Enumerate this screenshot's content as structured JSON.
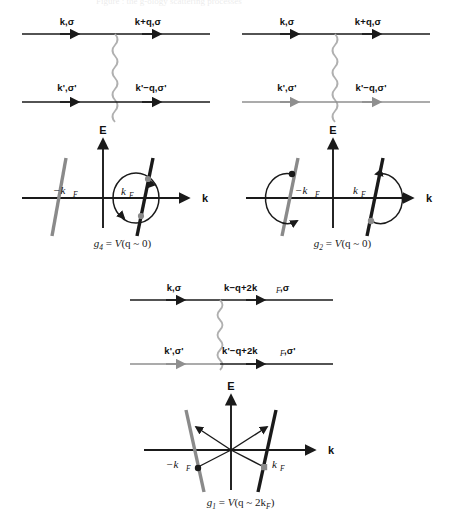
{
  "figure": {
    "header_faint": "Figure : the g-ology scattering processes",
    "background": "#ffffff",
    "colors": {
      "black": "#1a1a1a",
      "gray": "#8f8f8f",
      "wavy": "#b0b0b0",
      "band_black": "#1a1a1a",
      "band_gray": "#8a8a8a"
    }
  },
  "panels": [
    {
      "id": "g4",
      "diagram": {
        "top_in": "k,σ",
        "top_out": "k+q,σ",
        "bottom_in": "k',σ'",
        "bottom_out": "k'−q,σ'",
        "top_line_color": "#1a1a1a",
        "bottom_line_color": "#1a1a1a",
        "wavy_color": "#b0b0b0"
      },
      "plot": {
        "y_axis_label": "E",
        "x_axis_label": "k",
        "left_tick": "−k",
        "left_tick_sub": "F",
        "right_tick": "k",
        "right_tick_sub": "F",
        "left_band_color": "#8a8a8a",
        "right_band_color": "#1a1a1a",
        "annotation": "full loop at +kF"
      },
      "caption": {
        "name": "g",
        "sub": "4",
        "eq": " = ",
        "rhs_v": "V",
        "rhs_arg": "(q ~ 0)"
      }
    },
    {
      "id": "g2",
      "diagram": {
        "top_in": "k,σ",
        "top_out": "k+q,σ",
        "bottom_in": "k',σ'",
        "bottom_out": "k'−q,σ'",
        "top_line_color": "#1a1a1a",
        "bottom_line_color": "#8f8f8f",
        "wavy_color": "#b0b0b0"
      },
      "plot": {
        "y_axis_label": "E",
        "x_axis_label": "k",
        "left_tick": "−k",
        "left_tick_sub": "F",
        "right_tick": "k",
        "right_tick_sub": "F",
        "left_band_color": "#8a8a8a",
        "right_band_color": "#1a1a1a",
        "annotation": "half arcs at both ±kF"
      },
      "caption": {
        "name": "g",
        "sub": "2",
        "eq": " = ",
        "rhs_v": "V",
        "rhs_arg": "(q ~ 0)"
      }
    },
    {
      "id": "g1",
      "diagram": {
        "top_in": "k,σ",
        "top_out": "k−q+2k",
        "top_out_sub": "F",
        "top_out_tail": ",σ",
        "bottom_in": "k',σ'",
        "bottom_out": "k'−q+2k",
        "bottom_out_sub": "F",
        "bottom_out_tail": ",σ'",
        "top_line_color": "#1a1a1a",
        "bottom_line_color": "#8f8f8f",
        "wavy_color": "#b0b0b0"
      },
      "plot": {
        "y_axis_label": "E",
        "x_axis_label": "k",
        "left_tick": "−k",
        "left_tick_sub": "F",
        "right_tick": "k",
        "right_tick_sub": "F",
        "left_band_color": "#8a8a8a",
        "right_band_color": "#1a1a1a",
        "annotation": "crossed backscattering arrows between ∓kF"
      },
      "caption": {
        "name": "g",
        "sub": "1",
        "eq": " = ",
        "rhs_v": "V",
        "rhs_arg": "(q ~ 2k",
        "rhs_arg_sub": "F",
        "rhs_arg_tail": ")"
      }
    }
  ]
}
